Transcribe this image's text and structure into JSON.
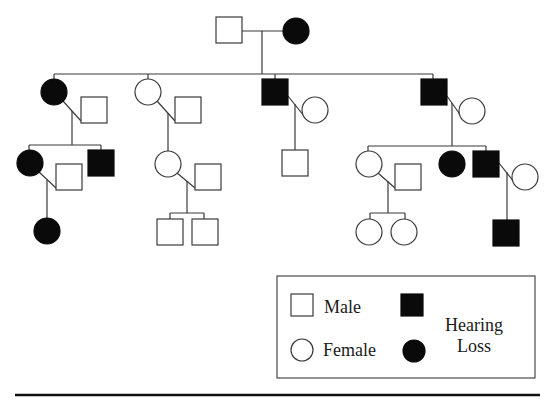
{
  "figure": {
    "colors": {
      "affected": "#0a0a0a",
      "unaffected": "#ffffff",
      "line": "#3a3a3a"
    }
  },
  "legend": {
    "male_label": "Male",
    "female_label": "Female",
    "affected_label_line1": "Hearing",
    "affected_label_line2": "Loss"
  },
  "pedigree": {
    "individuals": [
      {
        "id": "I-1",
        "generation": 1,
        "sex": "male",
        "affected": false,
        "x": 216,
        "y": 17,
        "size": 26
      },
      {
        "id": "I-2",
        "generation": 1,
        "sex": "female",
        "affected": true,
        "x": 296,
        "y": 31,
        "r": 13
      },
      {
        "id": "II-1",
        "generation": 2,
        "sex": "female",
        "affected": true,
        "x": 54,
        "y": 92,
        "r": 13
      },
      {
        "id": "II-1-spouse",
        "generation": 2,
        "sex": "male",
        "affected": false,
        "x": 81,
        "y": 97,
        "size": 26
      },
      {
        "id": "II-2",
        "generation": 2,
        "sex": "female",
        "affected": false,
        "x": 148,
        "y": 92,
        "r": 13
      },
      {
        "id": "II-2-spouse",
        "generation": 2,
        "sex": "male",
        "affected": false,
        "x": 175,
        "y": 97,
        "size": 26
      },
      {
        "id": "II-3",
        "generation": 2,
        "sex": "male",
        "affected": true,
        "x": 262,
        "y": 79,
        "size": 26
      },
      {
        "id": "II-3-spouse",
        "generation": 2,
        "sex": "female",
        "affected": false,
        "x": 315,
        "y": 110,
        "r": 13
      },
      {
        "id": "II-4",
        "generation": 2,
        "sex": "male",
        "affected": true,
        "x": 421,
        "y": 79,
        "size": 26
      },
      {
        "id": "II-4-spouse",
        "generation": 2,
        "sex": "female",
        "affected": false,
        "x": 472,
        "y": 111,
        "r": 13
      },
      {
        "id": "III-1",
        "generation": 3,
        "sex": "female",
        "affected": true,
        "x": 30,
        "y": 163,
        "r": 13
      },
      {
        "id": "III-1-spouse",
        "generation": 3,
        "sex": "male",
        "affected": false,
        "x": 56,
        "y": 164,
        "size": 26
      },
      {
        "id": "III-2",
        "generation": 3,
        "sex": "male",
        "affected": true,
        "x": 88,
        "y": 150,
        "size": 26
      },
      {
        "id": "III-3",
        "generation": 3,
        "sex": "female",
        "affected": false,
        "x": 168,
        "y": 164,
        "r": 13
      },
      {
        "id": "III-3-spouse",
        "generation": 3,
        "sex": "male",
        "affected": false,
        "x": 195,
        "y": 164,
        "size": 26
      },
      {
        "id": "III-4",
        "generation": 3,
        "sex": "male",
        "affected": false,
        "x": 282,
        "y": 150,
        "size": 26
      },
      {
        "id": "III-5",
        "generation": 3,
        "sex": "female",
        "affected": false,
        "x": 369,
        "y": 164,
        "r": 13
      },
      {
        "id": "III-5-spouse",
        "generation": 3,
        "sex": "male",
        "affected": false,
        "x": 395,
        "y": 164,
        "size": 26
      },
      {
        "id": "III-6",
        "generation": 3,
        "sex": "female",
        "affected": true,
        "x": 452,
        "y": 164,
        "r": 13
      },
      {
        "id": "III-7",
        "generation": 3,
        "sex": "male",
        "affected": true,
        "x": 473,
        "y": 151,
        "size": 26
      },
      {
        "id": "III-7-spouse",
        "generation": 3,
        "sex": "female",
        "affected": false,
        "x": 525,
        "y": 177,
        "r": 13
      },
      {
        "id": "IV-1",
        "generation": 4,
        "sex": "female",
        "affected": true,
        "x": 47,
        "y": 231,
        "r": 13
      },
      {
        "id": "IV-2",
        "generation": 4,
        "sex": "male",
        "affected": false,
        "x": 157,
        "y": 219,
        "size": 26
      },
      {
        "id": "IV-3",
        "generation": 4,
        "sex": "male",
        "affected": false,
        "x": 192,
        "y": 219,
        "size": 26
      },
      {
        "id": "IV-4",
        "generation": 4,
        "sex": "female",
        "affected": false,
        "x": 369,
        "y": 232,
        "r": 13
      },
      {
        "id": "IV-5",
        "generation": 4,
        "sex": "female",
        "affected": false,
        "x": 404,
        "y": 232,
        "r": 13
      },
      {
        "id": "IV-6",
        "generation": 4,
        "sex": "male",
        "affected": true,
        "x": 493,
        "y": 220,
        "size": 26
      }
    ],
    "lines": [
      {
        "type": "marriage",
        "x1": 242,
        "y1": 31,
        "x2": 283,
        "y2": 31
      },
      {
        "type": "descent",
        "x1": 262,
        "y1": 31,
        "x2": 262,
        "y2": 74
      },
      {
        "type": "sibship",
        "x1": 54,
        "y1": 74,
        "x2": 433,
        "y2": 74
      },
      {
        "type": "drop",
        "x1": 54,
        "y1": 74,
        "x2": 54,
        "y2": 79
      },
      {
        "type": "drop",
        "x1": 148,
        "y1": 74,
        "x2": 148,
        "y2": 79
      },
      {
        "type": "drop",
        "x1": 275,
        "y1": 74,
        "x2": 275,
        "y2": 79
      },
      {
        "type": "drop",
        "x1": 433,
        "y1": 74,
        "x2": 433,
        "y2": 79
      },
      {
        "type": "marriage",
        "x1": 63,
        "y1": 101,
        "x2": 81,
        "y2": 121
      },
      {
        "type": "descent",
        "x1": 72,
        "y1": 111,
        "x2": 72,
        "y2": 145
      },
      {
        "type": "sibship",
        "x1": 29,
        "y1": 145,
        "x2": 101,
        "y2": 145
      },
      {
        "type": "drop",
        "x1": 29,
        "y1": 145,
        "x2": 29,
        "y2": 150
      },
      {
        "type": "drop",
        "x1": 101,
        "y1": 145,
        "x2": 101,
        "y2": 150
      },
      {
        "type": "marriage",
        "x1": 157,
        "y1": 101,
        "x2": 175,
        "y2": 121
      },
      {
        "type": "descent",
        "x1": 168,
        "y1": 113,
        "x2": 168,
        "y2": 151
      },
      {
        "type": "marriage",
        "x1": 288,
        "y1": 96,
        "x2": 304,
        "y2": 116
      },
      {
        "type": "descent",
        "x1": 295,
        "y1": 104,
        "x2": 295,
        "y2": 150
      },
      {
        "type": "marriage",
        "x1": 447,
        "y1": 96,
        "x2": 461,
        "y2": 116
      },
      {
        "type": "descent",
        "x1": 452,
        "y1": 103,
        "x2": 452,
        "y2": 146
      },
      {
        "type": "sibship",
        "x1": 368,
        "y1": 146,
        "x2": 486,
        "y2": 146
      },
      {
        "type": "drop",
        "x1": 368,
        "y1": 146,
        "x2": 368,
        "y2": 151
      },
      {
        "type": "drop",
        "x1": 486,
        "y1": 146,
        "x2": 486,
        "y2": 151
      },
      {
        "type": "marriage",
        "x1": 39,
        "y1": 172,
        "x2": 56,
        "y2": 188
      },
      {
        "type": "descent",
        "x1": 47,
        "y1": 180,
        "x2": 47,
        "y2": 218
      },
      {
        "type": "marriage",
        "x1": 177,
        "y1": 173,
        "x2": 195,
        "y2": 188
      },
      {
        "type": "descent",
        "x1": 187,
        "y1": 181,
        "x2": 187,
        "y2": 213
      },
      {
        "type": "sibship",
        "x1": 170,
        "y1": 213,
        "x2": 204,
        "y2": 213
      },
      {
        "type": "drop",
        "x1": 170,
        "y1": 213,
        "x2": 170,
        "y2": 219
      },
      {
        "type": "drop",
        "x1": 204,
        "y1": 213,
        "x2": 204,
        "y2": 219
      },
      {
        "type": "marriage",
        "x1": 378,
        "y1": 173,
        "x2": 395,
        "y2": 188
      },
      {
        "type": "descent",
        "x1": 388,
        "y1": 181,
        "x2": 388,
        "y2": 213
      },
      {
        "type": "sibship",
        "x1": 370,
        "y1": 213,
        "x2": 405,
        "y2": 213
      },
      {
        "type": "drop",
        "x1": 370,
        "y1": 213,
        "x2": 370,
        "y2": 219
      },
      {
        "type": "drop",
        "x1": 405,
        "y1": 213,
        "x2": 405,
        "y2": 219
      },
      {
        "type": "marriage",
        "x1": 499,
        "y1": 163,
        "x2": 514,
        "y2": 182
      },
      {
        "type": "descent",
        "x1": 507,
        "y1": 172,
        "x2": 507,
        "y2": 220
      }
    ]
  },
  "legend_layout": {
    "box": {
      "x": 277,
      "y": 276,
      "w": 258,
      "h": 102
    },
    "male_symbol": {
      "x": 291,
      "y": 294,
      "size": 22
    },
    "female_symbol": {
      "cx": 302,
      "cy": 350,
      "r": 11
    },
    "affected_male_symbol": {
      "x": 401,
      "y": 294,
      "size": 22
    },
    "affected_female_symbol": {
      "cx": 414,
      "cy": 351,
      "r": 11
    }
  },
  "rule": {
    "x1": 15,
    "y1": 395,
    "x2": 540,
    "y2": 395
  }
}
